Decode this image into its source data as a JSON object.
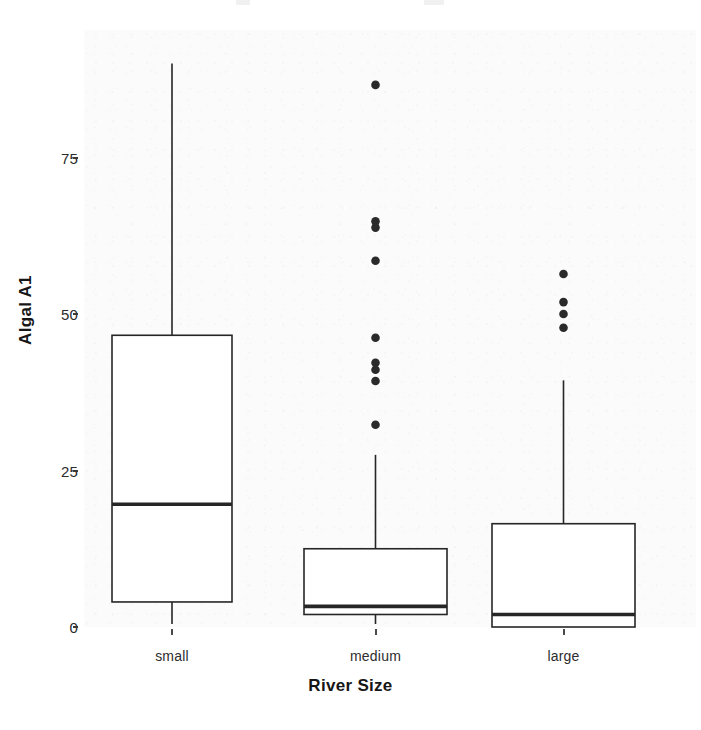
{
  "figure": {
    "background_color": "#ffffff",
    "panel_color": "#fbfbfb",
    "ink_color": "#262626"
  },
  "axes": {
    "y_title": "Algal A1",
    "x_title": "River Size",
    "y_ticks": [
      "0",
      "25",
      "50",
      "75"
    ],
    "x_ticks": [
      "small",
      "medium",
      "large"
    ]
  },
  "chart_data": {
    "type": "box",
    "title": "",
    "xlabel": "River Size",
    "ylabel": "Algal A1",
    "categories": [
      "small",
      "medium",
      "large"
    ],
    "ylim": [
      -2,
      95
    ],
    "y_ticks": [
      0,
      25,
      50,
      75
    ],
    "grid": false,
    "legend": "none",
    "boxes": [
      {
        "category": "small",
        "whisker_low": 0.0,
        "q1": 4.0,
        "median": 19.6,
        "q3": 46.6,
        "whisker_high": 90.0,
        "outliers": []
      },
      {
        "category": "medium",
        "whisker_low": 0.0,
        "q1": 2.0,
        "median": 3.3,
        "q3": 12.5,
        "whisker_high": 27.5,
        "outliers": [
          86.6,
          64.8,
          63.8,
          58.5,
          46.2,
          42.2,
          41.1,
          39.3,
          32.3
        ]
      },
      {
        "category": "large",
        "whisker_low": 0.0,
        "q1": 0.0,
        "median": 2.0,
        "q3": 16.5,
        "whisker_high": 39.4,
        "outliers": [
          56.4,
          51.9,
          50.0,
          47.8
        ]
      }
    ]
  }
}
